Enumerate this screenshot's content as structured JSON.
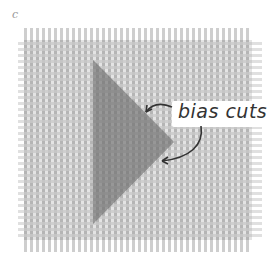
{
  "figure": {
    "panel_label": "c",
    "annotation": "bias cuts",
    "colors": {
      "background": "#ffffff",
      "warp_thread": "#b8b8b8",
      "weft_thread": "#c8c8c8",
      "triangle_fill": "#6e6e6e",
      "arrow": "#333333",
      "text": "#333333"
    },
    "fabric": {
      "x": 18,
      "y": 28,
      "width": 244,
      "height": 224
    },
    "triangle": {
      "points": [
        [
          93,
          60
        ],
        [
          174,
          142
        ],
        [
          93,
          224
        ]
      ]
    }
  }
}
